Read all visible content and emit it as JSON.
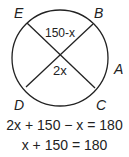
{
  "diagram": {
    "points": {
      "E": "E",
      "B": "B",
      "A": "A",
      "D": "D",
      "C": "C"
    },
    "angle_top": "150-x",
    "angle_center": "2x"
  },
  "equations": [
    "2x + 150 − x = 180",
    "x + 150 = 180"
  ]
}
